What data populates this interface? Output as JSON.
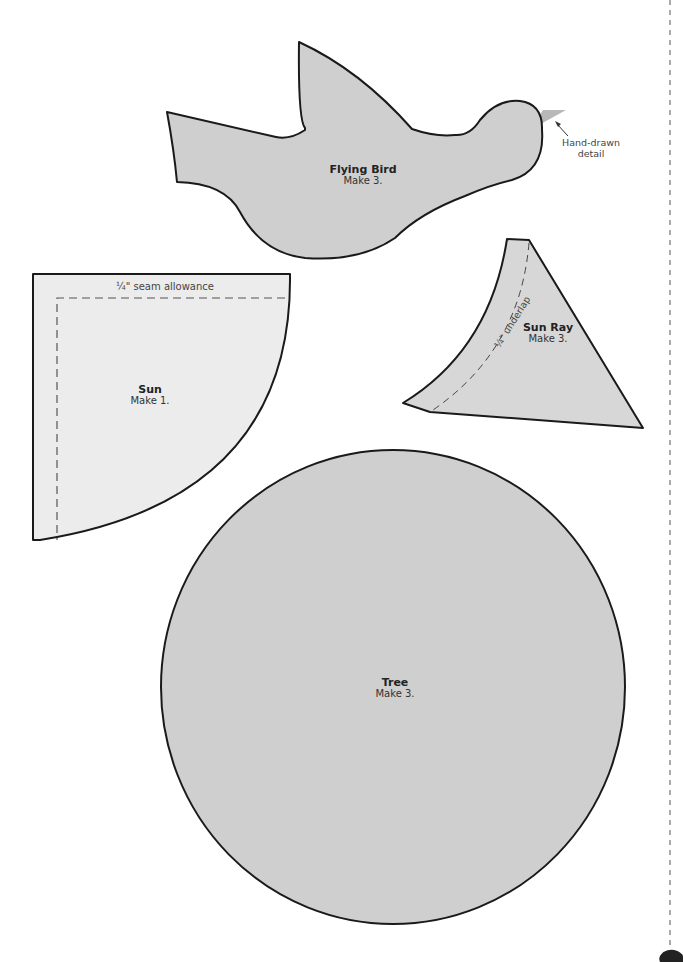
{
  "colors": {
    "background": "#ffffff",
    "shape_fill_dark": "#cfcfcf",
    "shape_fill_light": "#ececec",
    "outline": "#1a1a1a",
    "beak_fill": "#b8b8b8"
  },
  "templates": {
    "flying_bird": {
      "title": "Flying Bird",
      "instruction": "Make 3.",
      "annotation": "Hand-drawn detail",
      "annotation_line1": "Hand-drawn",
      "annotation_line2": "detail"
    },
    "sun": {
      "title": "Sun",
      "instruction": "Make 1.",
      "seam_note": "¼\" seam allowance"
    },
    "sun_ray": {
      "title": "Sun Ray",
      "instruction": "Make 3.",
      "underlap_note": "¼\" underlap"
    },
    "tree": {
      "title": "Tree",
      "instruction": "Make 3."
    }
  },
  "page_edge": {
    "cut_line": "dashed",
    "page_tab": "dark-half-circle"
  }
}
